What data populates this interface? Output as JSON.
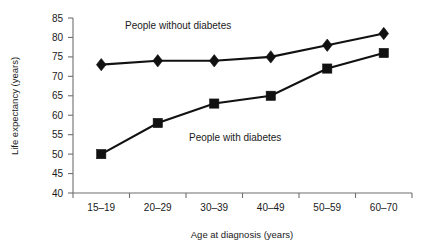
{
  "chart_data": {
    "type": "line",
    "title": "",
    "xlabel": "Age at diagnosis (years)",
    "ylabel": "Life expectancy (years)",
    "categories": [
      "15–19",
      "20–29",
      "30–39",
      "40–49",
      "50–59",
      "60–70"
    ],
    "ylim": [
      40,
      85
    ],
    "yticks": [
      40,
      45,
      50,
      55,
      60,
      65,
      70,
      75,
      80,
      85
    ],
    "ytick_labels": [
      "40",
      "45",
      "50",
      "55",
      "60",
      "65",
      "70",
      "75",
      "80",
      "85"
    ],
    "grid": false,
    "legend_position": "inline-annotation",
    "series": [
      {
        "name": "People without diabetes",
        "marker": "diamond",
        "values": [
          73,
          74,
          74,
          75,
          78,
          81
        ]
      },
      {
        "name": "People with diabetes",
        "marker": "square",
        "values": [
          50,
          58,
          63,
          65,
          72,
          76
        ]
      }
    ],
    "annotations": [
      {
        "text": "People without diabetes",
        "x_px": 125,
        "y_px": 29
      },
      {
        "text": "People with diabetes",
        "x_px": 189,
        "y_px": 141
      }
    ],
    "colors": {
      "series": "#111111",
      "axis": "#6f6f6f",
      "text": "#1a1a1a",
      "background": "#ffffff"
    }
  },
  "axis_titles": {
    "x": "Age at diagnosis (years)",
    "y": "Life expectancy (years)"
  }
}
